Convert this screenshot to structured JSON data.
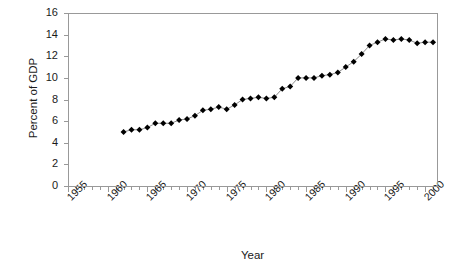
{
  "chart_data": {
    "type": "line",
    "title": "",
    "xlabel": "Year",
    "ylabel": "Percent of GDP",
    "xlim": [
      1955,
      2001.5
    ],
    "ylim": [
      0,
      16
    ],
    "grid": false,
    "legend": "none",
    "marker": "diamond",
    "marker_color": "#000000",
    "line_color": "#808080",
    "axis_color": "#999999",
    "x_tick_labels": [
      "1955",
      "1960",
      "1965",
      "1970",
      "1975",
      "1980",
      "1985",
      "1990",
      "1995",
      "2000"
    ],
    "x_tick_values": [
      1955,
      1960,
      1965,
      1970,
      1975,
      1980,
      1985,
      1990,
      1995,
      2000
    ],
    "x_minor_tick_interval": 1,
    "y_tick_labels": [
      "0",
      "2",
      "4",
      "6",
      "8",
      "10",
      "12",
      "14",
      "16"
    ],
    "y_tick_values": [
      0,
      2,
      4,
      6,
      8,
      10,
      12,
      14,
      16
    ],
    "x": [
      1962,
      1963,
      1964,
      1965,
      1966,
      1967,
      1968,
      1969,
      1970,
      1971,
      1972,
      1973,
      1974,
      1975,
      1976,
      1977,
      1978,
      1979,
      1980,
      1981,
      1982,
      1983,
      1984,
      1985,
      1986,
      1987,
      1988,
      1989,
      1990,
      1991,
      1992,
      1993,
      1994,
      1995,
      1996,
      1997,
      1998,
      1999,
      2000,
      2001
    ],
    "values": [
      5.0,
      5.2,
      5.2,
      5.4,
      5.8,
      5.8,
      5.8,
      6.1,
      6.2,
      6.5,
      7.0,
      7.1,
      7.3,
      7.1,
      7.5,
      8.0,
      8.1,
      8.2,
      8.1,
      8.2,
      9.0,
      9.2,
      10.0,
      10.0,
      10.0,
      10.2,
      10.3,
      10.5,
      11.0,
      11.5,
      12.2,
      13.0,
      13.3,
      13.6,
      13.5,
      13.6,
      13.5,
      13.2,
      13.3,
      13.3
    ],
    "series": [
      {
        "name": "Percent of GDP",
        "values": [
          5.0,
          5.2,
          5.2,
          5.4,
          5.8,
          5.8,
          5.8,
          6.1,
          6.2,
          6.5,
          7.0,
          7.1,
          7.3,
          7.1,
          7.5,
          8.0,
          8.1,
          8.2,
          8.1,
          8.2,
          9.0,
          9.2,
          10.0,
          10.0,
          10.0,
          10.2,
          10.3,
          10.5,
          11.0,
          11.5,
          12.2,
          13.0,
          13.3,
          13.6,
          13.5,
          13.6,
          13.5,
          13.2,
          13.3,
          13.3
        ]
      }
    ]
  }
}
